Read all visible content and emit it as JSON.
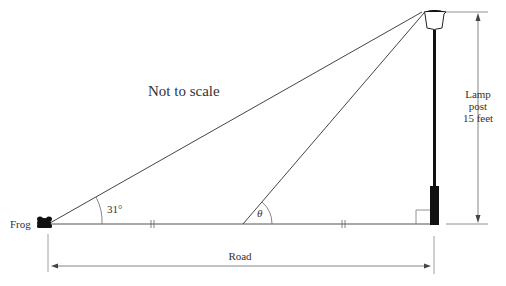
{
  "diagram": {
    "note": "Not to scale",
    "labels": {
      "frog": "Frog",
      "angle_frog": "31°",
      "angle_theta": "θ",
      "lamp_line1": "Lamp",
      "lamp_line2": "post",
      "lamp_line3": "15 feet",
      "road": "Road"
    },
    "colors": {
      "line": "#444444",
      "post": "#111111",
      "text": "#333333"
    }
  }
}
